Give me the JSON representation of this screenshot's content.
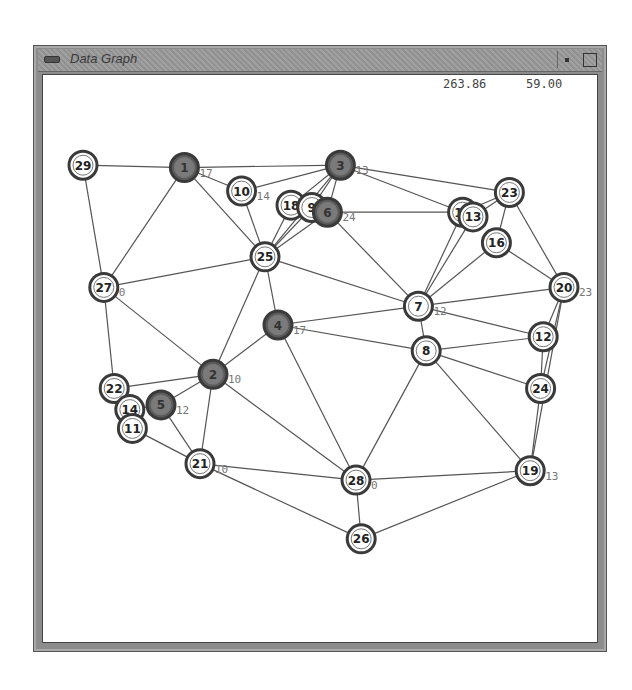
{
  "window": {
    "title": "Data Graph",
    "readout_x": "263.86",
    "readout_y": "59.00"
  },
  "colors": {
    "edge": "#555555",
    "node_ring": "#3a3a3a",
    "node_fill_normal": "#ffffff",
    "node_fill_selected": "#7a7a7a",
    "label": "#222222",
    "weight_label": "#777777"
  },
  "graph": {
    "nodes": [
      {
        "id": "29",
        "x": 0.05,
        "y": 0.06,
        "selected": false
      },
      {
        "id": "1",
        "x": 0.245,
        "y": 0.065,
        "selected": true,
        "weight": "17"
      },
      {
        "id": "10",
        "x": 0.355,
        "y": 0.115,
        "selected": false,
        "weight": "14"
      },
      {
        "id": "18",
        "x": 0.45,
        "y": 0.145,
        "selected": false
      },
      {
        "id": "9",
        "x": 0.49,
        "y": 0.15,
        "selected": false
      },
      {
        "id": "6",
        "x": 0.52,
        "y": 0.16,
        "selected": true,
        "weight": "24"
      },
      {
        "id": "3",
        "x": 0.545,
        "y": 0.06,
        "selected": true,
        "weight": "13"
      },
      {
        "id": "25",
        "x": 0.4,
        "y": 0.255,
        "selected": false
      },
      {
        "id": "15",
        "x": 0.78,
        "y": 0.16,
        "selected": false
      },
      {
        "id": "13",
        "x": 0.8,
        "y": 0.17,
        "selected": false
      },
      {
        "id": "23",
        "x": 0.87,
        "y": 0.118,
        "selected": false
      },
      {
        "id": "16",
        "x": 0.845,
        "y": 0.225,
        "selected": false
      },
      {
        "id": "27",
        "x": 0.09,
        "y": 0.32,
        "selected": false,
        "weight": "0"
      },
      {
        "id": "20",
        "x": 0.975,
        "y": 0.32,
        "selected": false,
        "weight": "23"
      },
      {
        "id": "7",
        "x": 0.695,
        "y": 0.36,
        "selected": false,
        "weight": "12"
      },
      {
        "id": "4",
        "x": 0.425,
        "y": 0.4,
        "selected": true,
        "weight": "17"
      },
      {
        "id": "12",
        "x": 0.935,
        "y": 0.425,
        "selected": false
      },
      {
        "id": "8",
        "x": 0.71,
        "y": 0.455,
        "selected": false
      },
      {
        "id": "2",
        "x": 0.3,
        "y": 0.505,
        "selected": true,
        "weight": "10"
      },
      {
        "id": "22",
        "x": 0.11,
        "y": 0.535,
        "selected": false
      },
      {
        "id": "24",
        "x": 0.93,
        "y": 0.535,
        "selected": false
      },
      {
        "id": "14",
        "x": 0.14,
        "y": 0.58,
        "selected": false
      },
      {
        "id": "11",
        "x": 0.145,
        "y": 0.62,
        "selected": false
      },
      {
        "id": "5",
        "x": 0.2,
        "y": 0.57,
        "selected": true,
        "weight": "12"
      },
      {
        "id": "21",
        "x": 0.275,
        "y": 0.695,
        "selected": false,
        "weight": "10"
      },
      {
        "id": "28",
        "x": 0.575,
        "y": 0.73,
        "selected": false,
        "weight": "0"
      },
      {
        "id": "19",
        "x": 0.91,
        "y": 0.71,
        "selected": false,
        "weight": "13"
      },
      {
        "id": "26",
        "x": 0.585,
        "y": 0.855,
        "selected": false
      }
    ],
    "edges": [
      [
        "29",
        "1"
      ],
      [
        "29",
        "27"
      ],
      [
        "1",
        "3"
      ],
      [
        "1",
        "10"
      ],
      [
        "1",
        "27"
      ],
      [
        "1",
        "25"
      ],
      [
        "3",
        "10"
      ],
      [
        "3",
        "18"
      ],
      [
        "3",
        "9"
      ],
      [
        "3",
        "6"
      ],
      [
        "3",
        "15"
      ],
      [
        "3",
        "23"
      ],
      [
        "3",
        "25"
      ],
      [
        "10",
        "25"
      ],
      [
        "18",
        "25"
      ],
      [
        "9",
        "25"
      ],
      [
        "6",
        "25"
      ],
      [
        "6",
        "15"
      ],
      [
        "6",
        "7"
      ],
      [
        "15",
        "23"
      ],
      [
        "13",
        "23"
      ],
      [
        "15",
        "7"
      ],
      [
        "13",
        "7"
      ],
      [
        "23",
        "16"
      ],
      [
        "23",
        "20"
      ],
      [
        "16",
        "7"
      ],
      [
        "16",
        "20"
      ],
      [
        "25",
        "27"
      ],
      [
        "25",
        "7"
      ],
      [
        "25",
        "4"
      ],
      [
        "25",
        "2"
      ],
      [
        "27",
        "22"
      ],
      [
        "27",
        "2"
      ],
      [
        "7",
        "20"
      ],
      [
        "7",
        "4"
      ],
      [
        "7",
        "8"
      ],
      [
        "7",
        "12"
      ],
      [
        "20",
        "12"
      ],
      [
        "20",
        "24"
      ],
      [
        "20",
        "19"
      ],
      [
        "4",
        "2"
      ],
      [
        "4",
        "28"
      ],
      [
        "4",
        "8"
      ],
      [
        "8",
        "12"
      ],
      [
        "8",
        "24"
      ],
      [
        "8",
        "19"
      ],
      [
        "8",
        "28"
      ],
      [
        "12",
        "24"
      ],
      [
        "24",
        "19"
      ],
      [
        "2",
        "22"
      ],
      [
        "2",
        "5"
      ],
      [
        "2",
        "21"
      ],
      [
        "2",
        "28"
      ],
      [
        "22",
        "14"
      ],
      [
        "14",
        "11"
      ],
      [
        "5",
        "21"
      ],
      [
        "11",
        "21"
      ],
      [
        "14",
        "5"
      ],
      [
        "21",
        "28"
      ],
      [
        "28",
        "19"
      ],
      [
        "28",
        "26"
      ],
      [
        "26",
        "19"
      ],
      [
        "21",
        "26"
      ]
    ]
  }
}
